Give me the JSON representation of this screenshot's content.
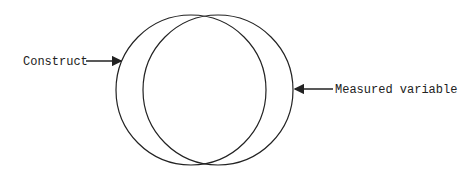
{
  "diagram": {
    "type": "overlapping-circles",
    "labels": {
      "left": "Construct",
      "right": "Measured variable"
    },
    "circles": [
      {
        "name": "construct",
        "cx": 191,
        "cy": 90,
        "r": 75
      },
      {
        "name": "measured-variable",
        "cx": 218,
        "cy": 90,
        "r": 75
      }
    ],
    "colors": {
      "stroke": "#222222",
      "background": "#ffffff"
    }
  }
}
